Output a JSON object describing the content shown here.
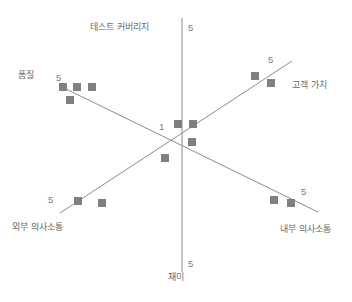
{
  "chart_data": {
    "type": "scatter",
    "title": "",
    "subtitle": "",
    "xlabel": "",
    "ylabel": "",
    "grid": false,
    "legend": null,
    "colors": {
      "marker": "#7f7f7f",
      "axis": "#8c8c8c",
      "text": "#6b6b6b"
    },
    "origin": {
      "x": 182,
      "y": 140
    },
    "axes": [
      {
        "name": "vertical-axis",
        "pole_positive_label": "테스트 커버리지",
        "pole_negative_label": "재미",
        "x1": 182,
        "y1": 18,
        "x2": 182,
        "y2": 272,
        "ticks": [
          {
            "value": "5",
            "x": 188,
            "y": 22
          },
          {
            "value": "1",
            "x": 159,
            "y": 121
          },
          {
            "value": "5",
            "x": 188,
            "y": 258
          }
        ]
      },
      {
        "name": "descending-diagonal-axis",
        "pole_positive_label": "품질",
        "pole_negative_label": "내부 의사소통",
        "x1": 62,
        "y1": 87,
        "x2": 318,
        "y2": 212,
        "ticks": [
          {
            "value": "5",
            "x": 56,
            "y": 72
          },
          {
            "value": "5",
            "x": 301,
            "y": 186
          }
        ]
      },
      {
        "name": "ascending-diagonal-axis",
        "pole_positive_label": "고객 가치",
        "pole_negative_label": "외부 의사소통",
        "x1": 60,
        "y1": 213,
        "x2": 292,
        "y2": 61,
        "ticks": [
          {
            "value": "5",
            "x": 48,
            "y": 194
          },
          {
            "value": "5",
            "x": 268,
            "y": 54
          }
        ]
      }
    ],
    "pole_labels": [
      {
        "name": "label-test-coverage",
        "text": "테스트 커버리지",
        "x": 90,
        "y": 22,
        "axis": "vertical",
        "pole": "top"
      },
      {
        "name": "label-quality",
        "text": "품질",
        "x": 18,
        "y": 70,
        "axis": "descending-diagonal",
        "pole": "upper-left"
      },
      {
        "name": "label-customer-value",
        "text": "고객 가치",
        "x": 292,
        "y": 80,
        "axis": "ascending-diagonal",
        "pole": "upper-right"
      },
      {
        "name": "label-external-communication",
        "text": "외부 의사소통",
        "x": 12,
        "y": 222,
        "axis": "ascending-diagonal",
        "pole": "lower-left"
      },
      {
        "name": "label-internal-communication",
        "text": "내부 의사소통",
        "x": 280,
        "y": 224,
        "axis": "descending-diagonal",
        "pole": "lower-right"
      },
      {
        "name": "label-fun",
        "text": "재미",
        "x": 168,
        "y": 272,
        "axis": "vertical",
        "pole": "bottom"
      }
    ],
    "points": [
      {
        "x": 63,
        "y": 87,
        "group": "quality"
      },
      {
        "x": 77,
        "y": 87,
        "group": "quality"
      },
      {
        "x": 92,
        "y": 87,
        "group": "quality"
      },
      {
        "x": 70,
        "y": 100,
        "group": "quality"
      },
      {
        "x": 255,
        "y": 76,
        "group": "customer-value"
      },
      {
        "x": 271,
        "y": 83,
        "group": "customer-value"
      },
      {
        "x": 178,
        "y": 124,
        "group": "center"
      },
      {
        "x": 193,
        "y": 124,
        "group": "center"
      },
      {
        "x": 192,
        "y": 142,
        "group": "center"
      },
      {
        "x": 165,
        "y": 158,
        "group": "center"
      },
      {
        "x": 78,
        "y": 201,
        "group": "external-communication"
      },
      {
        "x": 102,
        "y": 203,
        "group": "external-communication"
      },
      {
        "x": 274,
        "y": 200,
        "group": "internal-communication"
      },
      {
        "x": 291,
        "y": 203,
        "group": "internal-communication"
      }
    ],
    "marker": {
      "shape": "square",
      "size": 8
    }
  }
}
